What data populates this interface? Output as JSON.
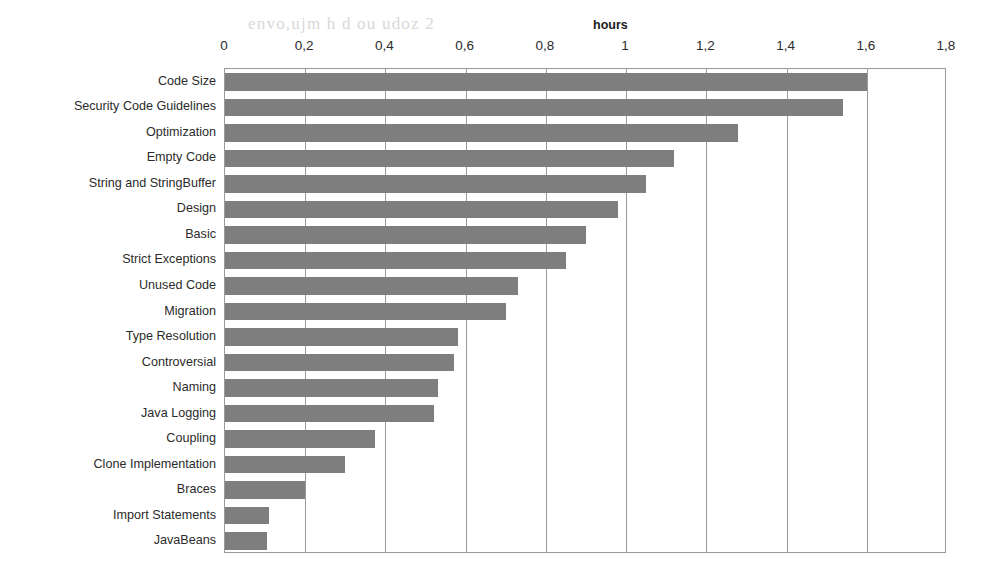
{
  "chart_data": {
    "type": "bar",
    "orientation": "horizontal",
    "title": "hours",
    "xlabel": "hours",
    "ylabel": "",
    "xlim": [
      0,
      1.8
    ],
    "grid": true,
    "legend": false,
    "bar_color": "#7e7e7e",
    "axis_color": "#9a9a9a",
    "xticks": [
      "0",
      "0,2",
      "0,4",
      "0,6",
      "0,8",
      "1",
      "1,2",
      "1,4",
      "1,6",
      "1,8"
    ],
    "xtick_values": [
      0,
      0.2,
      0.4,
      0.6,
      0.8,
      1.0,
      1.2,
      1.4,
      1.6,
      1.8
    ],
    "categories": [
      "Code Size",
      "Security Code Guidelines",
      "Optimization",
      "Empty Code",
      "String and StringBuffer",
      "Design",
      "Basic",
      "Strict Exceptions",
      "Unused Code",
      "Migration",
      "Type Resolution",
      "Controversial",
      "Naming",
      "Java Logging",
      "Coupling",
      "Clone Implementation",
      "Braces",
      "Import Statements",
      "JavaBeans"
    ],
    "values": [
      1.6,
      1.54,
      1.28,
      1.12,
      1.05,
      0.98,
      0.9,
      0.85,
      0.73,
      0.7,
      0.58,
      0.57,
      0.53,
      0.52,
      0.375,
      0.3,
      0.2,
      0.11,
      0.105
    ]
  },
  "background_artifacts": [
    {
      "text": "envo,ujm h d ou udoz 2",
      "x": 248,
      "y": 14
    },
    {
      "text": "Nl n.",
      "x": 640,
      "y": 180
    }
  ]
}
